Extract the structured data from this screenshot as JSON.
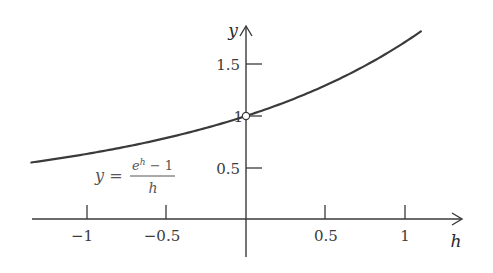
{
  "chart_data": {
    "type": "line",
    "title": "",
    "xlabel": "h",
    "ylabel": "y",
    "xlim": [
      -1.35,
      1.35
    ],
    "ylim": [
      -0.4,
      1.9
    ],
    "grid": false,
    "legend": null,
    "x_ticks": [
      -1,
      -0.5,
      0.5,
      1
    ],
    "x_tick_labels": [
      "−1",
      "−0.5",
      "0.5",
      "1"
    ],
    "y_ticks": [
      0.5,
      1,
      1.5
    ],
    "y_tick_labels": [
      "0.5",
      "1",
      "1.5"
    ],
    "series": [
      {
        "name": "y = (e^h - 1)/h",
        "function": "(exp(h)-1)/h",
        "x": [
          -1.35,
          -1.0,
          -0.5,
          0.0,
          0.5,
          1.0,
          1.1
        ],
        "values": [
          0.548,
          0.632,
          0.787,
          1.0,
          1.297,
          1.718,
          1.824
        ]
      }
    ],
    "annotations": [
      {
        "type": "open-point",
        "x": 0,
        "y": 1,
        "note": "removable discontinuity at h = 0"
      },
      {
        "type": "label",
        "text": "y = (e^h − 1)/h",
        "x": -0.75,
        "y": 0.4
      }
    ]
  },
  "labels": {
    "x_axis": "h",
    "y_axis": "y",
    "ticks_x": [
      "−1",
      "−0.5",
      "0.5",
      "1"
    ],
    "ticks_y": [
      "1.5",
      "1",
      "0.5"
    ],
    "formula_lhs": "y =",
    "formula_num": "eʰ − 1",
    "formula_num_base": "e",
    "formula_num_exp": "h",
    "formula_num_rest": " − 1",
    "formula_den": "h"
  },
  "colors": {
    "axis": "#3a3a3a",
    "curve": "#3a3a3a",
    "text": "#3a3a3a"
  }
}
